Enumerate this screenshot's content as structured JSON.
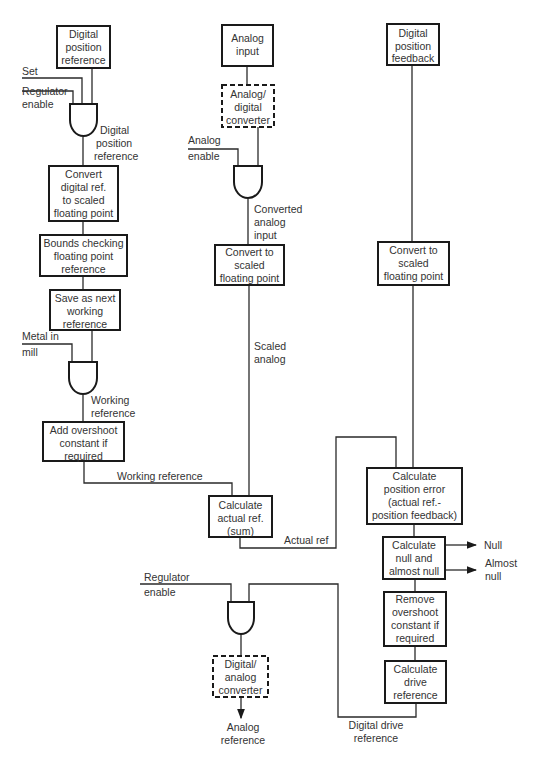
{
  "diagram": {
    "colors": {
      "line": "#1a1a1a",
      "text": "#333333",
      "background": "#ffffff"
    },
    "boxes": {
      "digital_position_reference": [
        "Digital",
        "position",
        "reference"
      ],
      "convert_digital_ref": [
        "Convert",
        "digital ref.",
        "to scaled",
        "floating point"
      ],
      "bounds_checking": [
        "Bounds checking",
        "floating point",
        "reference"
      ],
      "save_next_working": [
        "Save as next",
        "working",
        "reference"
      ],
      "add_overshoot": [
        "Add overshoot",
        "constant if",
        "required"
      ],
      "analog_input": [
        "Analog",
        "input"
      ],
      "ad_converter": [
        "Analog/",
        "digital",
        "converter"
      ],
      "convert_scaled_analog": [
        "Convert to",
        "scaled",
        "floating point"
      ],
      "calculate_actual_ref": [
        "Calculate",
        "actual ref.",
        "(sum)"
      ],
      "digital_position_feedback": [
        "Digital",
        "position",
        "feedback"
      ],
      "convert_scaled_feedback": [
        "Convert to",
        "scaled",
        "floating point"
      ],
      "calculate_position_error": [
        "Calculate",
        "position error",
        "(actual ref.-",
        "position feedback)"
      ],
      "calculate_null": [
        "Calculate",
        "null and",
        "almost null"
      ],
      "remove_overshoot": [
        "Remove",
        "overshoot",
        "constant if",
        "required"
      ],
      "calculate_drive_reference": [
        "Calculate",
        "drive",
        "reference"
      ],
      "da_converter": [
        "Digital/",
        "analog",
        "converter"
      ]
    },
    "labels": {
      "set": "Set",
      "regulator_enable_top": [
        "Regulator",
        "enable"
      ],
      "digital_position_reference_out": [
        "Digital",
        "position",
        "reference"
      ],
      "metal_in_mill": [
        "Metal in",
        "mill"
      ],
      "working_reference_gate": [
        "Working",
        "reference"
      ],
      "working_reference_line": "Working reference",
      "analog_enable": [
        "Analog",
        "enable"
      ],
      "converted_analog_input": [
        "Converted",
        "analog",
        "input"
      ],
      "scaled_analog": [
        "Scaled",
        "analog"
      ],
      "actual_ref": "Actual ref",
      "null": "Null",
      "almost_null": [
        "Almost",
        "null"
      ],
      "regulator_enable_bottom": [
        "Regulator",
        "enable"
      ],
      "analog_reference": [
        "Analog",
        "reference"
      ],
      "digital_drive_reference": [
        "Digital drive",
        "reference"
      ]
    }
  }
}
